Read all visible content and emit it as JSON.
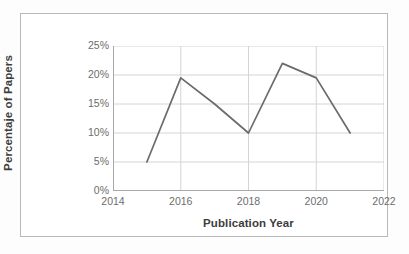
{
  "chart_data": {
    "type": "line",
    "title": "",
    "xlabel": "Publication Year",
    "ylabel": "Percentaje of Papers",
    "x": [
      2015,
      2016,
      2017,
      2018,
      2019,
      2020,
      2021
    ],
    "values": [
      5,
      19.5,
      15,
      10,
      22,
      19.5,
      10
    ],
    "series": [
      {
        "name": "Percentaje of Papers",
        "values": [
          5,
          19.5,
          15,
          10,
          22,
          19.5,
          10
        ]
      }
    ],
    "xlim": [
      2014,
      2022
    ],
    "ylim": [
      0,
      25
    ],
    "xticks": [
      2014,
      2016,
      2018,
      2020,
      2022
    ],
    "xtick_labels": [
      "2014",
      "2016",
      "2018",
      "2020",
      "2022"
    ],
    "yticks": [
      0,
      5,
      10,
      15,
      20,
      25
    ],
    "ytick_labels": [
      "0%",
      "5%",
      "10%",
      "15%",
      "20%",
      "25%"
    ],
    "grid": true,
    "grid_axis": "both",
    "legend": false,
    "legend_position": "none",
    "line_color": "#6b6b6b",
    "grid_color": "#d4d4d4",
    "axis_color": "#a8a8a8",
    "text_color": "#6d6d6d",
    "title_color": "#3d3d3d",
    "markers": false
  },
  "axes": {
    "y_title": "Percentaje of Papers",
    "x_title": "Publication Year",
    "y_ticks": [
      {
        "label": "25%",
        "value": 25
      },
      {
        "label": "20%",
        "value": 20
      },
      {
        "label": "15%",
        "value": 15
      },
      {
        "label": "10%",
        "value": 10
      },
      {
        "label": "5%",
        "value": 5
      },
      {
        "label": "0%",
        "value": 0
      }
    ],
    "x_ticks": [
      {
        "label": "2014",
        "value": 2014
      },
      {
        "label": "2016",
        "value": 2016
      },
      {
        "label": "2018",
        "value": 2018
      },
      {
        "label": "2020",
        "value": 2020
      },
      {
        "label": "2022",
        "value": 2022
      }
    ]
  }
}
